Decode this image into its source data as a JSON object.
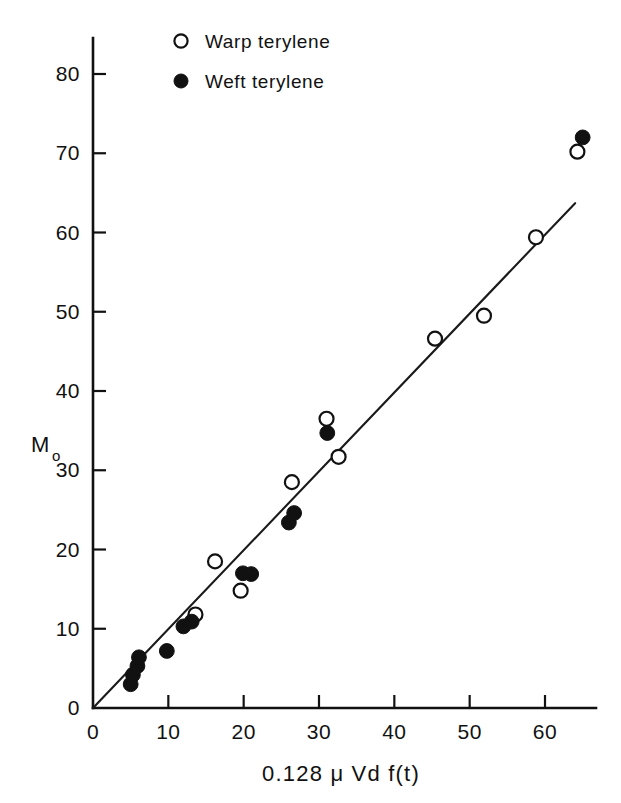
{
  "chart_data": {
    "type": "scatter",
    "title": "",
    "xlabel": "0.128 μ Vd f(t)",
    "ylabel": "M",
    "ylabel_sub": "o",
    "xlim": [
      0,
      66
    ],
    "ylim": [
      0,
      85
    ],
    "xticks": [
      0,
      10,
      20,
      30,
      40,
      50,
      60
    ],
    "yticks": [
      0,
      10,
      20,
      30,
      40,
      50,
      60,
      70,
      80
    ],
    "xtick_labels": [
      "0",
      "10",
      "20",
      "30",
      "40",
      "50",
      "60"
    ],
    "ytick_labels": [
      "0",
      "10",
      "20",
      "30",
      "40",
      "50",
      "60",
      "70",
      "80"
    ],
    "grid": false,
    "legend_position": "top-center",
    "legend": [
      {
        "name": "Warp terylene",
        "marker": "open-circle"
      },
      {
        "name": "Weft terylene",
        "marker": "filled-circle"
      }
    ],
    "series": [
      {
        "name": "Warp terylene",
        "marker": "open-circle",
        "points": [
          [
            13.6,
            11.8
          ],
          [
            16.2,
            18.5
          ],
          [
            19.6,
            14.8
          ],
          [
            26.4,
            28.5
          ],
          [
            31.0,
            36.5
          ],
          [
            32.6,
            31.7
          ],
          [
            45.4,
            46.6
          ],
          [
            51.9,
            49.5
          ],
          [
            58.8,
            59.4
          ],
          [
            64.3,
            70.2
          ]
        ]
      },
      {
        "name": "Weft terylene",
        "marker": "filled-circle",
        "points": [
          [
            5.0,
            3.0
          ],
          [
            5.3,
            4.2
          ],
          [
            5.9,
            5.3
          ],
          [
            6.1,
            6.4
          ],
          [
            9.8,
            7.2
          ],
          [
            12.0,
            10.3
          ],
          [
            13.1,
            10.9
          ],
          [
            19.9,
            17.0
          ],
          [
            21.0,
            16.9
          ],
          [
            26.0,
            23.4
          ],
          [
            26.7,
            24.6
          ],
          [
            31.1,
            34.7
          ],
          [
            65.0,
            72.0
          ]
        ]
      }
    ],
    "fit_line": {
      "name": "regression-line",
      "x0": 0.0,
      "y0": 0.0,
      "x1": 64.0,
      "y1": 63.7,
      "slope": 0.995,
      "intercept": 0.0
    }
  },
  "legend_render": {
    "items": [
      {
        "label": "Warp terylene",
        "marker": "open-circle"
      },
      {
        "label": "Weft terylene",
        "marker": "filled-circle"
      }
    ]
  }
}
